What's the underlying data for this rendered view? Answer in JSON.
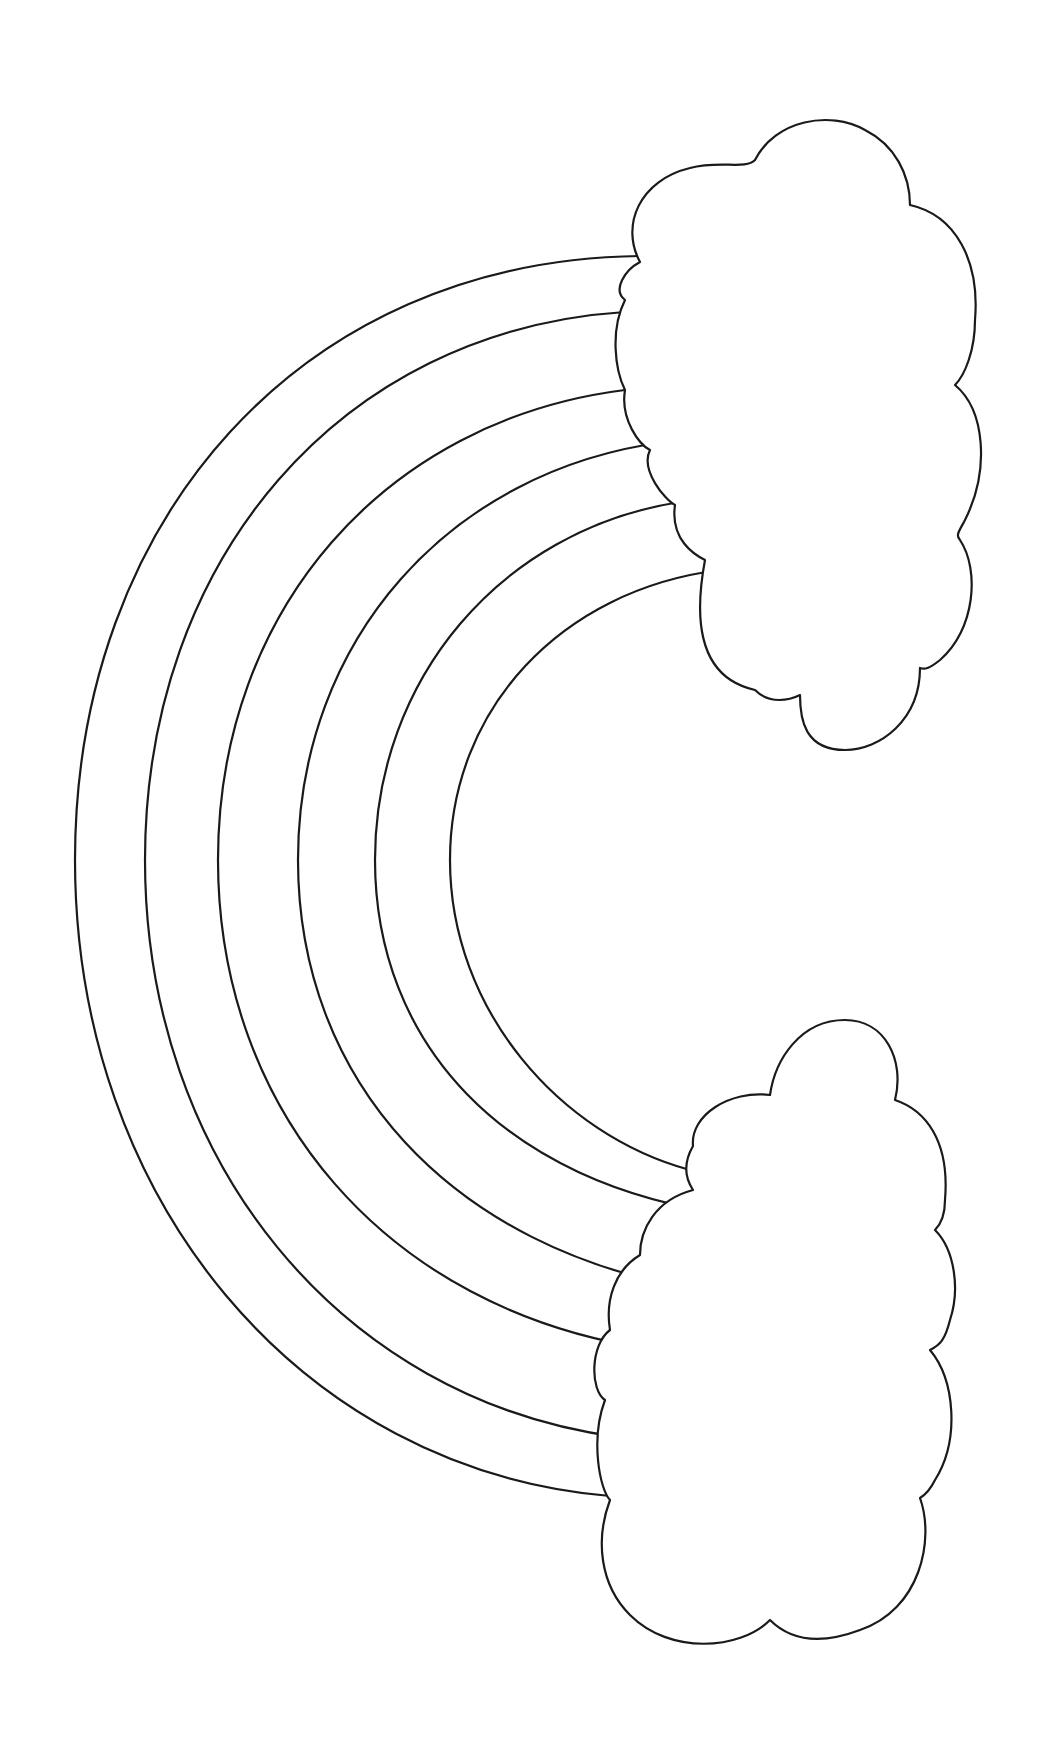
{
  "picture": {
    "subject": "rainbow coloring page",
    "elements": [
      "rainbow-arcs",
      "top-cloud",
      "bottom-cloud"
    ],
    "arc_count": 6,
    "colors": {
      "line": "#1a1a1a",
      "background": "#ffffff"
    }
  }
}
